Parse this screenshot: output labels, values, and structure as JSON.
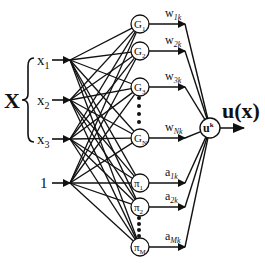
{
  "diagram": {
    "type": "neural-network",
    "input_group_label": "X",
    "inputs": [
      {
        "id": "x1",
        "label": "x",
        "sub": "1",
        "y": 60
      },
      {
        "id": "x2",
        "label": "x",
        "sub": "2",
        "y": 100
      },
      {
        "id": "x3",
        "label": "x",
        "sub": "3",
        "y": 139
      },
      {
        "id": "bias",
        "label": "1",
        "sub": "",
        "y": 183
      }
    ],
    "hidden_nodes": [
      {
        "id": "G1",
        "label": "G",
        "sub": "1",
        "y": 24,
        "weight": "w",
        "weight_sub": "1k"
      },
      {
        "id": "G2",
        "label": "G",
        "sub": "2",
        "y": 51,
        "weight": "w",
        "weight_sub": "2k"
      },
      {
        "id": "G3",
        "label": "G",
        "sub": "3",
        "y": 87,
        "weight": "w",
        "weight_sub": "3k"
      },
      {
        "id": "GN",
        "label": "G",
        "sub": "N",
        "y": 138,
        "weight": "w",
        "weight_sub": "Nk"
      },
      {
        "id": "pi1",
        "label": "π",
        "sub": "1",
        "y": 183,
        "weight": "a",
        "weight_sub": "1k"
      },
      {
        "id": "pi2",
        "label": "π",
        "sub": "2",
        "y": 207,
        "weight": "a",
        "weight_sub": "2k"
      },
      {
        "id": "piM",
        "label": "π",
        "sub": "M",
        "y": 247,
        "weight": "a",
        "weight_sub": "Mk"
      }
    ],
    "ellipsis_groups": [
      {
        "x": 139,
        "y_start": 98,
        "y_end": 122
      },
      {
        "x": 139,
        "y_start": 218,
        "y_end": 236
      }
    ],
    "output_node": {
      "label": "u",
      "sup": "k"
    },
    "output_label": "u(x)"
  }
}
